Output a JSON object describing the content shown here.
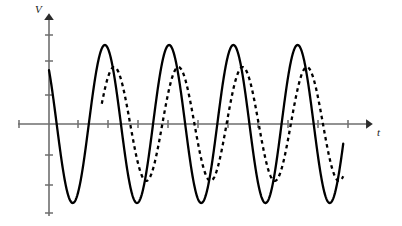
{
  "figure": {
    "axes": {
      "v_axis_label": "V",
      "t_axis_label": "t",
      "v_axis_x_px": 49,
      "v_axis_top_px": 14,
      "v_axis_bottom_px": 216,
      "t_axis_y_px": 124,
      "t_axis_left_px": 18,
      "t_axis_right_px": 372,
      "v_tick_positions_px": [
        35,
        60,
        95,
        155,
        185,
        213
      ],
      "t_tick_positions_px": [
        19,
        78,
        108,
        138,
        168,
        198,
        228,
        258,
        288,
        318,
        348
      ],
      "axis_color": "#6e6e6e",
      "curve_color": "#000000"
    },
    "chart_data": {
      "type": "line",
      "title": "",
      "xlabel": "t",
      "ylabel": "V",
      "xlim": [
        0,
        10
      ],
      "ylim": [
        -1.15,
        1.15
      ],
      "grid": false,
      "legend": "none",
      "series": [
        {
          "name": "solid-wave",
          "style": "solid",
          "color": "#000000",
          "linewidth": 2.3,
          "amplitude": 1.0,
          "period": 2.02,
          "phase_deg": 47,
          "x_start": 0.0,
          "x_end": 9.25,
          "y_at_start": 0.67,
          "peaks_px_x": [
            108,
            168,
            228,
            289
          ],
          "troughs_px_x": [
            78,
            139,
            199,
            259,
            319
          ],
          "peak_y_px": 45,
          "trough_y_px": 200
        },
        {
          "name": "dashed-wave",
          "style": "dashed",
          "color": "#000000",
          "linewidth": 2.3,
          "dash_pattern": "3.6 3.6",
          "amplitude": 0.72,
          "period": 2.02,
          "phase_deg": -5,
          "x_start": 1.66,
          "x_end": 9.25,
          "y_at_start": 0.0,
          "peaks_px_x": [
            128,
            188,
            248,
            309
          ],
          "troughs_px_x": [
            158,
            218,
            278,
            338
          ],
          "peak_y_px": 68,
          "trough_y_px": 182
        }
      ]
    }
  }
}
